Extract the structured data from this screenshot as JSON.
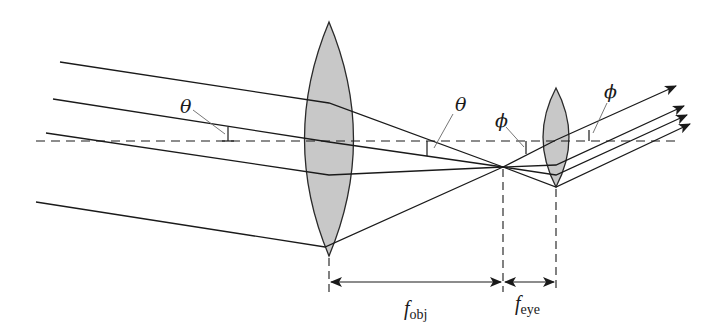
{
  "diagram": {
    "colors": {
      "line": "#1a1a1a",
      "lens_fill": "#c8c8c8",
      "background": "#ffffff"
    },
    "labels": {
      "theta_left": "θ",
      "theta_right": "θ",
      "phi_left": "ϕ",
      "phi_right": "ϕ",
      "f_obj_main": "f",
      "f_obj_sub": "obj",
      "f_eye_main": "f",
      "f_eye_sub": "eye"
    },
    "components": [
      {
        "name": "objective-lens",
        "type": "converging lens",
        "center_x": 329
      },
      {
        "name": "eyepiece-lens",
        "type": "converging lens",
        "center_x": 556
      },
      {
        "name": "optical-axis",
        "type": "dashed line"
      },
      {
        "name": "focal-point",
        "type": "shared focal point",
        "x": 503
      }
    ],
    "dimensions": [
      {
        "label": "f_obj",
        "from": "objective-lens",
        "to": "focal-point"
      },
      {
        "label": "f_eye",
        "from": "focal-point",
        "to": "eyepiece-lens"
      }
    ]
  }
}
